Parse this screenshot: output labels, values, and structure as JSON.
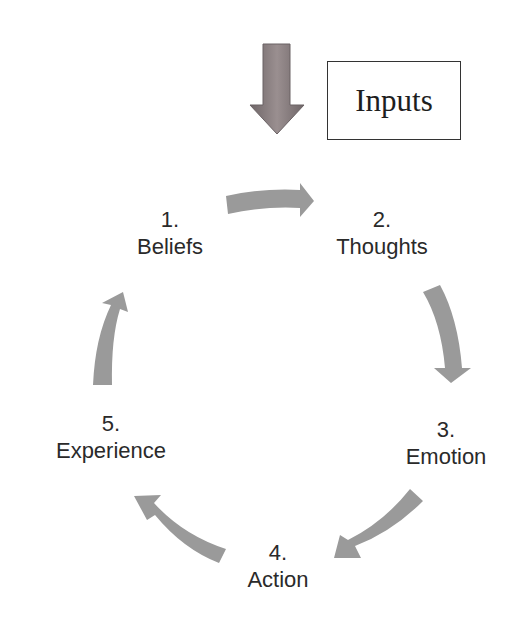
{
  "diagram": {
    "type": "cycle",
    "input": {
      "label": "Inputs",
      "arrow": "down-arrow",
      "arrow_color": "#8a8082"
    },
    "arrow_color": "#9a9a9a",
    "text_color": "#2a2a2a",
    "steps": [
      {
        "number": "1.",
        "label": "Beliefs"
      },
      {
        "number": "2.",
        "label": "Thoughts"
      },
      {
        "number": "3.",
        "label": "Emotion"
      },
      {
        "number": "4.",
        "label": "Action"
      },
      {
        "number": "5.",
        "label": "Experience"
      }
    ]
  }
}
